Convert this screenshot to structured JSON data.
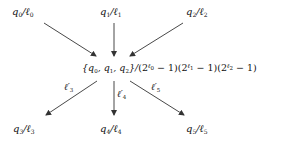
{
  "diagram": {
    "type": "flow",
    "sources": [
      {
        "id": "q0",
        "q": "q",
        "q_sub": "0",
        "l": "ℓ",
        "l_sub": "0"
      },
      {
        "id": "q1",
        "q": "q",
        "q_sub": "1",
        "l": "ℓ",
        "l_sub": "1"
      },
      {
        "id": "q2",
        "q": "q",
        "q_sub": "2",
        "l": "ℓ",
        "l_sub": "2"
      }
    ],
    "center": {
      "open": "{",
      "q": "q",
      "subs": [
        "0",
        "1",
        "2"
      ],
      "sep": ", ",
      "close": "}/",
      "factors": [
        {
          "base": "(2",
          "exp": "ℓ",
          "exp_sub": "0",
          "tail": " − 1)"
        },
        {
          "base": "(2",
          "exp": "ℓ",
          "exp_sub": "1",
          "tail": " − 1)"
        },
        {
          "base": "(2",
          "exp": "ℓ",
          "exp_sub": "2",
          "tail": " − 1)"
        }
      ]
    },
    "targets": [
      {
        "id": "q3",
        "q": "q",
        "q_sub": "3",
        "l": "ℓ",
        "l_sub": "3"
      },
      {
        "id": "q4",
        "q": "q",
        "q_sub": "4",
        "l": "ℓ",
        "l_sub": "4"
      },
      {
        "id": "q5",
        "q": "q",
        "q_sub": "5",
        "l": "ℓ",
        "l_sub": "5"
      }
    ],
    "edge_labels": [
      {
        "l": "ℓ′",
        "sub": "3"
      },
      {
        "l": "ℓ′",
        "sub": "4"
      },
      {
        "l": "ℓ′",
        "sub": "5"
      }
    ],
    "slash": "/",
    "edge_color": "#333333"
  }
}
